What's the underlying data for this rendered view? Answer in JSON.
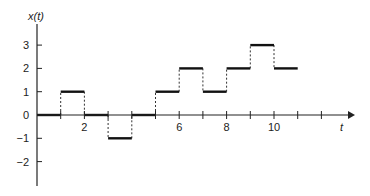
{
  "chart_data": {
    "type": "line",
    "subtype": "step",
    "title": "",
    "xlabel": "t",
    "ylabel": "x(t)",
    "xlim": [
      0,
      13
    ],
    "ylim": [
      -3,
      4
    ],
    "x_ticks": [
      1,
      2,
      3,
      4,
      5,
      6,
      7,
      8,
      9,
      10,
      11,
      12
    ],
    "x_tick_labels": {
      "2": "2",
      "6": "6",
      "8": "8",
      "10": "10"
    },
    "y_ticks": [
      -2,
      -1,
      1,
      2,
      3
    ],
    "y_tick_labels": [
      "-2",
      "-1",
      "0",
      "1",
      "2",
      "3"
    ],
    "grid": false,
    "legend": null,
    "segments": [
      {
        "t_start": 0,
        "t_end": 1,
        "value": 0
      },
      {
        "t_start": 1,
        "t_end": 2,
        "value": 1
      },
      {
        "t_start": 2,
        "t_end": 3,
        "value": 0
      },
      {
        "t_start": 3,
        "t_end": 4,
        "value": -1
      },
      {
        "t_start": 4,
        "t_end": 5,
        "value": 0
      },
      {
        "t_start": 5,
        "t_end": 6,
        "value": 1
      },
      {
        "t_start": 6,
        "t_end": 7,
        "value": 2
      },
      {
        "t_start": 7,
        "t_end": 8,
        "value": 1
      },
      {
        "t_start": 8,
        "t_end": 9,
        "value": 2
      },
      {
        "t_start": 9,
        "t_end": 10,
        "value": 3
      },
      {
        "t_start": 10,
        "t_end": 11,
        "value": 2
      }
    ],
    "transitions_style": "dashed vertical lines"
  },
  "labels": {
    "y_axis": "x(t)",
    "x_axis": "t"
  }
}
